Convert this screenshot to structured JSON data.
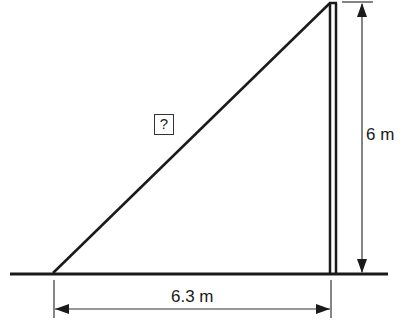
{
  "diagram": {
    "type": "right-triangle-ladder-problem",
    "unknown_label": "?",
    "height_label": "6 m",
    "base_label": "6.3 m",
    "colors": {
      "line": "#1a1a1a",
      "background": "#ffffff"
    }
  }
}
